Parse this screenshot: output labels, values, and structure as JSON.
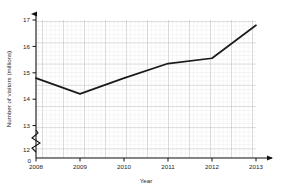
{
  "chart_data": {
    "type": "line",
    "title": "",
    "xlabel": "Year",
    "ylabel": "Number of visitors (millions)",
    "categories": [
      "2008",
      "2009",
      "2010",
      "2011",
      "2012",
      "2013"
    ],
    "x": [
      2008,
      2009,
      2010,
      2011,
      2012,
      2013
    ],
    "values": [
      14.8,
      14.2,
      14.8,
      15.35,
      15.55,
      16.8
    ],
    "series": [
      {
        "name": "Number of visitors",
        "values": [
          14.8,
          14.2,
          14.8,
          15.35,
          15.55,
          16.8
        ]
      }
    ],
    "xlim": [
      2008,
      2013
    ],
    "ylim": [
      12,
      17
    ],
    "y_ticks": [
      "12",
      "13",
      "14",
      "15",
      "16",
      "17"
    ],
    "x_ticks": [
      "2008",
      "2009",
      "2010",
      "2011",
      "2012",
      "2013"
    ],
    "origin_label": "0",
    "axis_break": true,
    "axis_break_note": "zigzag break on y-axis between 0 and 12",
    "grid": true,
    "grid_minor": true,
    "legend": "none",
    "line_color": "#1a1a1a",
    "grid_minor_color": "#d8d8d8",
    "grid_major_color": "#9a9a9a",
    "axis_color": "#111111",
    "background_color": "#ffffff"
  }
}
